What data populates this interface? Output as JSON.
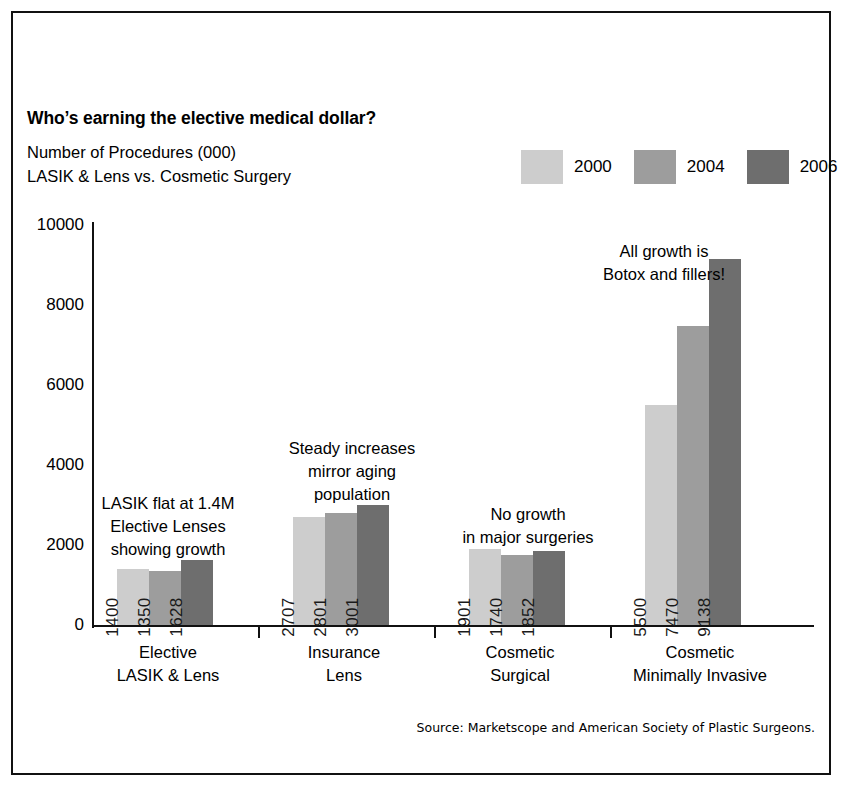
{
  "title": "Who’s earning the elective medical dollar?",
  "subtitle_line1": "Number of Procedures (000)",
  "subtitle_line2": "LASIK & Lens vs. Cosmetic Surgery",
  "source": "Source: Marketscope and American Society of Plastic Surgeons.",
  "colors": {
    "series_2000": "#cdcdcd",
    "series_2004": "#9d9d9d",
    "series_2006": "#6e6e6e",
    "axis": "#111111",
    "text": "#000000"
  },
  "legend": {
    "items": [
      {
        "label": "2000",
        "color": "#cdcdcd"
      },
      {
        "label": "2004",
        "color": "#9d9d9d"
      },
      {
        "label": "2006",
        "color": "#6e6e6e"
      }
    ]
  },
  "y_axis": {
    "ticks": [
      "0",
      "2000",
      "4000",
      "6000",
      "8000",
      "10000"
    ]
  },
  "categories": [
    {
      "line1": "Elective",
      "line2": "LASIK & Lens"
    },
    {
      "line1": "Insurance",
      "line2": "Lens"
    },
    {
      "line1": "Cosmetic",
      "line2": "Surgical"
    },
    {
      "line1": "Cosmetic",
      "line2": "Minimally Invasive"
    }
  ],
  "annotations": [
    {
      "line1": "LASIK flat at 1.4M",
      "line2": "Elective Lenses",
      "line3": "showing growth"
    },
    {
      "line1": "Steady increases",
      "line2": "mirror aging",
      "line3": "population"
    },
    {
      "line1": "No growth",
      "line2": "in major surgeries",
      "line3": ""
    },
    {
      "line1": "All growth is",
      "line2": "Botox and fillers!",
      "line3": ""
    }
  ],
  "bar_labels": {
    "g0": [
      "1400",
      "1350",
      "1628"
    ],
    "g1": [
      "2707",
      "2801",
      "3001"
    ],
    "g2": [
      "1901",
      "1740",
      "1852"
    ],
    "g3": [
      "5500",
      "7470",
      "9138"
    ]
  },
  "chart_data": {
    "type": "bar",
    "title": "Who’s earning the elective medical dollar?",
    "subtitle": "Number of Procedures (000) / LASIK & Lens vs. Cosmetic Surgery",
    "xlabel": "",
    "ylabel": "Number of Procedures (000)",
    "ylim": [
      0,
      10000
    ],
    "yticks": [
      0,
      2000,
      4000,
      6000,
      8000,
      10000
    ],
    "grid": false,
    "legend_position": "top-right",
    "categories": [
      "Elective LASIK & Lens",
      "Insurance Lens",
      "Cosmetic Surgical",
      "Cosmetic Minimally Invasive"
    ],
    "series": [
      {
        "name": "2000",
        "color": "#cdcdcd",
        "values": [
          1400,
          2707,
          1901,
          5500
        ]
      },
      {
        "name": "2004",
        "color": "#9d9d9d",
        "values": [
          1350,
          2801,
          1740,
          7470
        ]
      },
      {
        "name": "2006",
        "color": "#6e6e6e",
        "values": [
          1628,
          3001,
          1852,
          9138
        ]
      }
    ],
    "annotations": [
      "LASIK flat at 1.4M Elective Lenses showing growth",
      "Steady increases mirror aging population",
      "No growth in major surgeries",
      "All growth is Botox and fillers!"
    ],
    "source": "Source: Marketscope and American Society of Plastic Surgeons."
  }
}
